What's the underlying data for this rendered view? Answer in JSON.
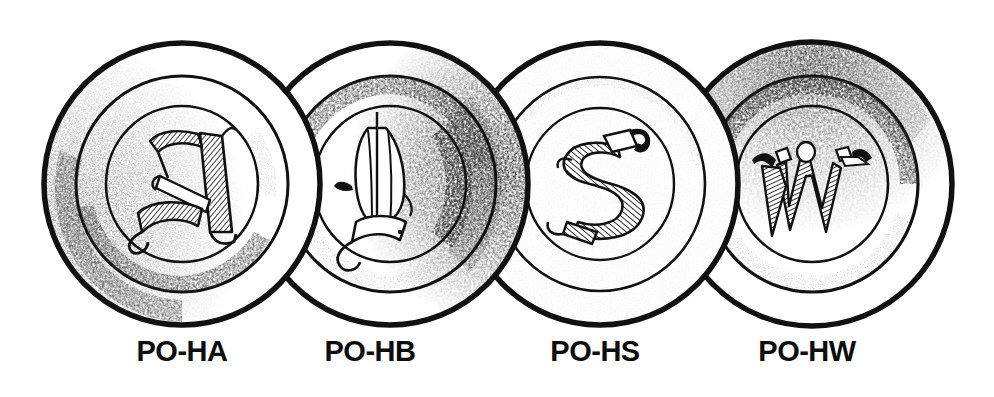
{
  "figure": {
    "type": "line-illustration",
    "background_color": "#ffffff",
    "ink_color": "#111111",
    "width": 994,
    "height": 397
  },
  "plates": [
    {
      "id": "plate-1",
      "label": "PO-HA",
      "monogram": "A",
      "monogram_style": "blackletter-hatched",
      "center_x": 182,
      "center_y": 184,
      "radius_x": 138,
      "radius_y": 142,
      "rings": [
        1.0,
        0.76,
        0.55
      ],
      "shading": "left-and-lower-left",
      "label_center_x": 182
    },
    {
      "id": "plate-2",
      "label": "PO-HB",
      "monogram": "B",
      "monogram_style": "blackletter-outline",
      "center_x": 390,
      "center_y": 184,
      "radius_x": 138,
      "radius_y": 142,
      "rings": [
        1.0,
        0.76,
        0.55
      ],
      "shading": "right-heavy",
      "label_center_x": 370
    },
    {
      "id": "plate-3",
      "label": "PO-HS",
      "monogram": "S",
      "monogram_style": "blackletter-hatched",
      "center_x": 600,
      "center_y": 184,
      "radius_x": 138,
      "radius_y": 142,
      "rings": [
        1.0,
        0.76,
        0.55
      ],
      "shading": "light",
      "label_center_x": 595
    },
    {
      "id": "plate-4",
      "label": "PO-HW",
      "monogram": "W",
      "monogram_style": "blackletter-hatched",
      "center_x": 812,
      "center_y": 184,
      "radius_x": 140,
      "radius_y": 142,
      "rings": [
        1.0,
        0.76,
        0.55
      ],
      "shading": "top-and-upper-left",
      "label_center_x": 807
    }
  ]
}
